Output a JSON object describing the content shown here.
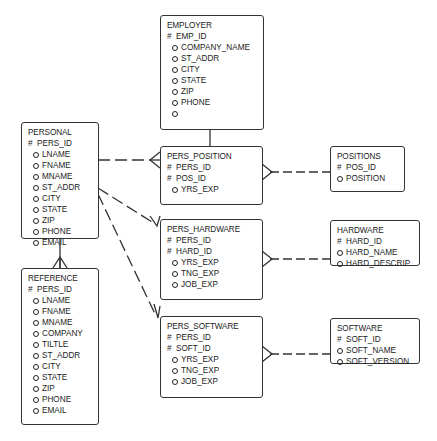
{
  "entities": {
    "employer": {
      "title": "EMPLOYER",
      "keys": [
        "EMP_ID"
      ],
      "attrs": [
        "COMPANY_NAME",
        "ST_ADDR",
        "CITY",
        "STATE",
        "ZIP",
        "PHONE",
        ""
      ]
    },
    "personal": {
      "title": "PERSONAL",
      "keys": [
        "PERS_ID"
      ],
      "attrs": [
        "LNAME",
        "FNAME",
        "MNAME",
        "ST_ADDR",
        "CITY",
        "STATE",
        "ZIP",
        "PHONE",
        "EMAIL"
      ]
    },
    "reference": {
      "title": "REFERENCE",
      "keys": [
        "PERS_ID"
      ],
      "attrs": [
        "LNAME",
        "FNAME",
        "MNAME",
        "COMPANY",
        "TILTLE",
        "ST_ADDR",
        "CITY",
        "STATE",
        "ZIP",
        "PHONE",
        "EMAIL"
      ]
    },
    "pers_position": {
      "title": "PERS_POSITION",
      "keys": [
        "PERS_ID",
        "POS_ID"
      ],
      "attrs": [
        "YRS_EXP"
      ]
    },
    "positions": {
      "title": "POSITIONS",
      "keys": [
        "POS_ID"
      ],
      "attrs": [
        "POSITION"
      ]
    },
    "pers_hardware": {
      "title": "PERS_HARDWARE",
      "keys": [
        "PERS_ID",
        "HARD_ID"
      ],
      "attrs": [
        "YRS_EXP",
        "TNG_EXP",
        "JOB_EXP"
      ]
    },
    "hardware": {
      "title": "HARDWARE",
      "keys": [
        "HARD_ID"
      ],
      "attrs": [
        "HARD_NAME",
        "HARD_DESCRIP"
      ]
    },
    "pers_software": {
      "title": "PERS_SOFTWARE",
      "keys": [
        "PERS_ID",
        "SOFT_ID"
      ],
      "attrs": [
        "YRS_EXP",
        "TNG_EXP",
        "JOB_EXP"
      ]
    },
    "software": {
      "title": "SOFTWARE",
      "keys": [
        "SOFT_ID"
      ],
      "attrs": [
        "SOFT_NAME",
        "SOFT_VERSION"
      ]
    }
  },
  "symbols": {
    "key_marker": "#",
    "optional_marker": "circle"
  },
  "relationships": [
    {
      "from": "employer",
      "to": "pers_position",
      "style": "solid",
      "to_cardinality": "one"
    },
    {
      "from": "personal",
      "to": "pers_position",
      "style": "dashed",
      "to_cardinality": "many"
    },
    {
      "from": "personal",
      "to": "pers_hardware",
      "style": "dashed",
      "to_cardinality": "many"
    },
    {
      "from": "personal",
      "to": "pers_software",
      "style": "dashed",
      "to_cardinality": "many"
    },
    {
      "from": "personal",
      "to": "reference",
      "style": "solid",
      "to_cardinality": "many"
    },
    {
      "from": "positions",
      "to": "pers_position",
      "style": "dashed",
      "to_cardinality": "many"
    },
    {
      "from": "hardware",
      "to": "pers_hardware",
      "style": "dashed",
      "to_cardinality": "many"
    },
    {
      "from": "software",
      "to": "pers_software",
      "style": "dashed",
      "to_cardinality": "many"
    }
  ]
}
